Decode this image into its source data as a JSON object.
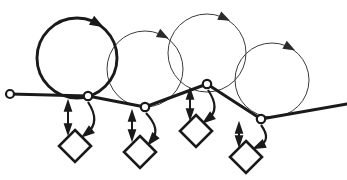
{
  "canvas": {
    "width": 347,
    "height": 180,
    "background": "#ffffff",
    "title": "Loop and transition diagram"
  },
  "style": {
    "ink": "#1a1a1a",
    "ink_light": "#3b3b3b",
    "fill": "#ffffff",
    "thick_stroke": 2.9,
    "thin_stroke": 1.0,
    "backbone_stroke": 3.0
  },
  "terminal": {
    "name": "left-terminal-node",
    "cx": 10,
    "cy": 94,
    "r": 4.0
  },
  "backbone": {
    "name": "backbone-path",
    "points": "10,94 88,96 145,107 207,84 261,119 347,104",
    "direction": "left-to-right"
  },
  "loops": [
    {
      "id": "loop-1",
      "cx": 77,
      "cy": 58,
      "r": 40,
      "weight": "thick",
      "arrow_angle_deg": -60,
      "arrow_direction": "clockwise"
    },
    {
      "id": "loop-2",
      "cx": 145,
      "cy": 69,
      "r": 38,
      "weight": "thin",
      "arrow_angle_deg": -62,
      "arrow_direction": "clockwise"
    },
    {
      "id": "loop-3",
      "cx": 207,
      "cy": 53,
      "r": 39,
      "weight": "thin",
      "arrow_angle_deg": -64,
      "arrow_direction": "clockwise"
    },
    {
      "id": "loop-4",
      "cx": 272,
      "cy": 80,
      "r": 37,
      "weight": "thin",
      "arrow_angle_deg": -62,
      "arrow_direction": "clockwise"
    }
  ],
  "junctions": [
    {
      "id": "junction-1",
      "cx": 88,
      "cy": 96,
      "r": 4.2
    },
    {
      "id": "junction-2",
      "cx": 145,
      "cy": 107,
      "r": 4.2
    },
    {
      "id": "junction-3",
      "cx": 207,
      "cy": 84,
      "r": 4.2
    },
    {
      "id": "junction-4",
      "cx": 261,
      "cy": 119,
      "r": 4.2
    }
  ],
  "transitions": [
    {
      "id": "transition-1",
      "diamond": {
        "cx": 75,
        "cy": 146,
        "half": 16
      },
      "double_arrow": {
        "x": 68,
        "y_top": 102,
        "y_bottom": 133
      },
      "curve": {
        "from_x": 88,
        "from_y": 102,
        "ctrl_x": 101,
        "ctrl_y": 122,
        "to_x": 87,
        "to_y": 133
      }
    },
    {
      "id": "transition-2",
      "diamond": {
        "cx": 140,
        "cy": 152,
        "half": 16
      },
      "double_arrow": {
        "x": 132,
        "y_top": 112,
        "y_bottom": 139
      },
      "curve": {
        "from_x": 146,
        "from_y": 113,
        "ctrl_x": 161,
        "ctrl_y": 129,
        "to_x": 152,
        "to_y": 140
      }
    },
    {
      "id": "transition-3",
      "diamond": {
        "cx": 196,
        "cy": 131,
        "half": 16
      },
      "double_arrow": {
        "x": 190,
        "y_top": 90,
        "y_bottom": 118
      },
      "curve": {
        "from_x": 208,
        "from_y": 90,
        "ctrl_x": 221,
        "ctrl_y": 109,
        "to_x": 208,
        "to_y": 119
      }
    },
    {
      "id": "transition-4",
      "diamond": {
        "cx": 246,
        "cy": 157,
        "half": 16
      },
      "double_arrow": {
        "x": 239,
        "y_top": 124,
        "y_bottom": 145
      },
      "curve": {
        "from_x": 261,
        "from_y": 125,
        "ctrl_x": 272,
        "ctrl_y": 140,
        "to_x": 259,
        "to_y": 146
      }
    }
  ],
  "labels": {
    "diagram_name": "Loop and transition diagram",
    "loop_count": 4,
    "transition_count": 4,
    "junction_count": 4
  }
}
